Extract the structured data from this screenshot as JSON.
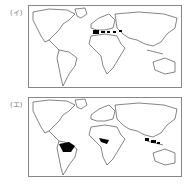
{
  "maps": [
    {
      "label": "(イ)",
      "highlight_regions": [
        "Mediterranean coast (Spain, Italy, Greece, Turkey)"
      ]
    },
    {
      "label": "(エ)",
      "highlight_regions": [
        "Amazon basin (South America)",
        "Congo basin (Central Africa)",
        "Southeast Asia (Indonesia/Malaysia)"
      ]
    }
  ],
  "colors": {
    "outline": "#333333",
    "fill": "#000000",
    "frame": "#888888"
  }
}
